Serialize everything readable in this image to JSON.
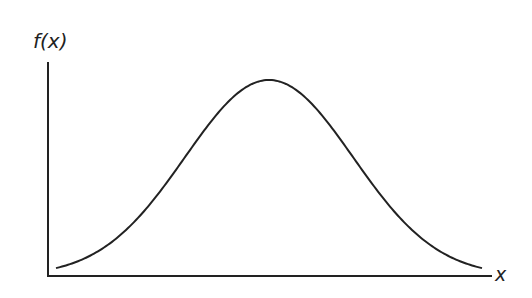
{
  "diagram": {
    "type": "normal-distribution-curve",
    "y_axis_label": "f(x)",
    "x_axis_label": "x",
    "stroke_color": "#222222",
    "background_color": "#ffffff"
  },
  "chart_data": {
    "type": "line",
    "title": "",
    "xlabel": "x",
    "ylabel": "f(x)",
    "grid": false,
    "legend": null
  }
}
